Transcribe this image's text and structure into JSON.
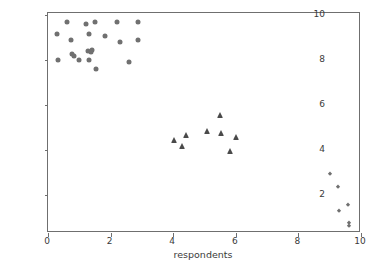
{
  "chart_data": {
    "type": "scatter",
    "title": "",
    "xlabel": "respondents",
    "ylabel": "sustainability impact",
    "xlim": [
      0,
      10
    ],
    "ylim": [
      0.3,
      10.1
    ],
    "grid": false,
    "legend": "none",
    "xticks": [
      0,
      2,
      4,
      6,
      8,
      10
    ],
    "yticks": [
      2,
      4,
      6,
      8,
      10
    ],
    "marker_color": "#707070",
    "triangle_color": "#4a4a4a",
    "axis_color": "#6f6f6f",
    "background": "#ffffff",
    "series": [
      {
        "name": "low respondents / high impact",
        "marker": "circle",
        "color": "#707070",
        "points": [
          [
            0.3,
            9.18
          ],
          [
            0.32,
            8.0
          ],
          [
            0.62,
            9.7
          ],
          [
            0.72,
            8.88
          ],
          [
            0.78,
            8.28
          ],
          [
            0.82,
            8.18
          ],
          [
            0.98,
            8.0
          ],
          [
            1.22,
            9.6
          ],
          [
            1.28,
            8.42
          ],
          [
            1.3,
            9.18
          ],
          [
            1.32,
            8.0
          ],
          [
            1.38,
            8.36
          ],
          [
            1.42,
            8.46
          ],
          [
            1.5,
            9.7
          ],
          [
            1.52,
            7.6
          ],
          [
            1.82,
            9.08
          ],
          [
            2.2,
            9.7
          ],
          [
            2.3,
            8.8
          ],
          [
            2.58,
            7.9
          ],
          [
            2.86,
            9.68
          ],
          [
            2.88,
            8.88
          ]
        ]
      },
      {
        "name": "mid respondents / mid impact",
        "marker": "triangle",
        "color": "#4a4a4a",
        "points": [
          [
            4.02,
            4.46
          ],
          [
            4.28,
            4.18
          ],
          [
            4.42,
            4.66
          ],
          [
            5.08,
            4.86
          ],
          [
            5.48,
            5.56
          ],
          [
            5.52,
            4.76
          ],
          [
            5.82,
            3.96
          ],
          [
            6.0,
            4.56
          ]
        ]
      },
      {
        "name": "high respondents / low impact",
        "marker": "diamond",
        "color": "#707070",
        "points": [
          [
            9.02,
            2.94
          ],
          [
            9.28,
            2.36
          ],
          [
            9.58,
            1.56
          ],
          [
            9.3,
            1.28
          ],
          [
            9.62,
            0.76
          ],
          [
            9.62,
            0.62
          ]
        ]
      }
    ]
  }
}
